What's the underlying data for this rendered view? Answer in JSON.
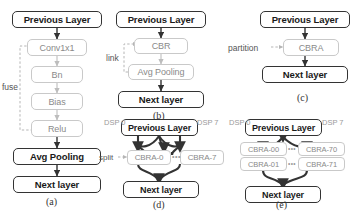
{
  "figure": {
    "subfigures": [
      {
        "id": "a",
        "caption": "(a)",
        "annotation": "fuse",
        "nodes": [
          {
            "label": "Previous Layer",
            "style": "strong"
          },
          {
            "label": "Conv1x1",
            "style": "light"
          },
          {
            "label": "Bn",
            "style": "light"
          },
          {
            "label": "Bias",
            "style": "light"
          },
          {
            "label": "Relu",
            "style": "light"
          },
          {
            "label": "Avg Pooling",
            "style": "strong"
          },
          {
            "label": "Next layer",
            "style": "strong"
          }
        ]
      },
      {
        "id": "b",
        "caption": "(b)",
        "annotation": "link",
        "nodes": [
          {
            "label": "Previous Layer",
            "style": "strong"
          },
          {
            "label": "CBR",
            "style": "light"
          },
          {
            "label": "Avg Pooling",
            "style": "light"
          },
          {
            "label": "Next layer",
            "style": "strong"
          }
        ]
      },
      {
        "id": "c",
        "caption": "(c)",
        "annotation": "partition",
        "nodes": [
          {
            "label": "Previous Layer",
            "style": "strong"
          },
          {
            "label": "CBRA",
            "style": "light"
          },
          {
            "label": "Next layer",
            "style": "strong"
          }
        ]
      },
      {
        "id": "d",
        "caption": "(d)",
        "annotation": "split",
        "dsp_left": "DSP 0",
        "dsp_right": "DSP 7",
        "ellipsis": "•••",
        "nodes": [
          {
            "label": "Previous Layer",
            "style": "strong"
          },
          {
            "label": "CBRA-0",
            "style": "light"
          },
          {
            "label": "CBRA-7",
            "style": "light"
          },
          {
            "label": "Next layer",
            "style": "strong"
          }
        ]
      },
      {
        "id": "e",
        "caption": "(e)",
        "dsp_left": "DSP 0",
        "dsp_right": "DSP 7",
        "ellipsis_top": "•••",
        "ellipsis_bottom": "•••",
        "nodes": [
          {
            "label": "Previous Layer",
            "style": "strong"
          },
          {
            "label": "CBRA-00",
            "style": "light"
          },
          {
            "label": "CBRA-70",
            "style": "light"
          },
          {
            "label": "CBRA-01",
            "style": "light"
          },
          {
            "label": "CBRA-71",
            "style": "light"
          },
          {
            "label": "Next layer",
            "style": "strong"
          }
        ]
      }
    ]
  },
  "colors": {
    "strong_border": "#333333",
    "light_border": "#c9c9c9",
    "light_text": "#8a8a8a",
    "annotation_text": "#555555",
    "dsp_text": "#9a9a9a"
  }
}
